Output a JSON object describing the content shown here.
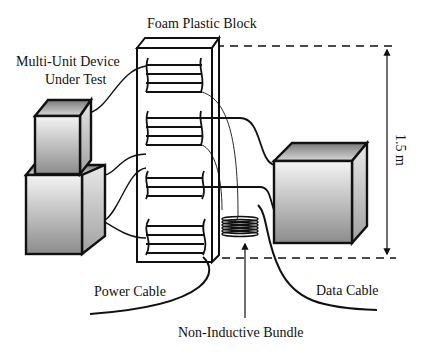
{
  "diagram": {
    "labels": {
      "foam_block": "Foam Plastic Block",
      "device_line1": "Multi-Unit Device",
      "device_line2": "Under Test",
      "height": "1.5 m",
      "power_cable": "Power Cable",
      "data_cable": "Data Cable",
      "bundle": "Non-Inductive Bundle"
    },
    "colors": {
      "stroke": "#111111",
      "box_light": "#f2f2f2",
      "box_dark": "#8a8a8a",
      "background": "#ffffff"
    }
  }
}
